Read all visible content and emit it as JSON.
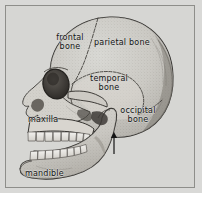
{
  "figure": {
    "view": "lateral",
    "style": "engraved stipple illustration",
    "background_color": "#d6d6d3",
    "plate_color": "#d9d9d7",
    "border_color": "#8e8e8a",
    "ink_color": "#141414"
  },
  "labels": {
    "frontal": "frontal\nbone",
    "parietal": "parietal bone",
    "temporal": "temporal\nbone",
    "occipital": "occipital\nbone",
    "maxilla": "maxilla",
    "mandible": "mandible"
  },
  "annotations": {
    "pointer_arrow": "arrow-up-marker"
  },
  "parts": [
    {
      "id": "frontal-bone",
      "label": "frontal bone"
    },
    {
      "id": "parietal-bone",
      "label": "parietal bone"
    },
    {
      "id": "temporal-bone",
      "label": "temporal bone"
    },
    {
      "id": "occipital-bone",
      "label": "occipital bone"
    },
    {
      "id": "maxilla",
      "label": "maxilla"
    },
    {
      "id": "mandible",
      "label": "mandible"
    }
  ]
}
